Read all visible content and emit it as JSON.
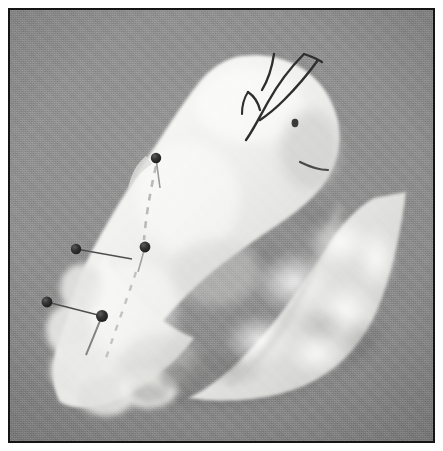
{
  "photo": {
    "title": "Pinned white plush bird form on gray background",
    "subject": "white-fabric-bird-craft",
    "border_color": "#141414",
    "border_width_px": 2,
    "outer_margin_px": 8,
    "frame": {
      "width_px": 427,
      "height_px": 435
    },
    "canvas": {
      "width_px": 443,
      "height_px": 451
    },
    "background": {
      "name": "studio-gray-paper",
      "color": "#8b8b8b",
      "highlight_color": "#949494",
      "shadow_color": "#7d7d7d"
    },
    "objects": {
      "body": {
        "name": "white-plush-body",
        "color": "#f2f2f0",
        "shade_color": "#d8d8d6",
        "description": "Large white quilted body panel, teardrop shaped, tilted left"
      },
      "wing": {
        "name": "white-fur-wing-panel",
        "color": "#eeeeec",
        "shade_color": "#cfcfcd",
        "description": "Fluffy white fur triangular wing panel on the right"
      },
      "eye": {
        "name": "stitched-eye",
        "color": "#3a3a3a",
        "cx": 285,
        "cy": 113
      },
      "beak_line": {
        "name": "stitched-beak-line",
        "color": "#4a4a4a"
      }
    },
    "threads": [
      {
        "name": "thread-crest-long",
        "color": "#2e2e2e"
      },
      {
        "name": "thread-crest-short",
        "color": "#2e2e2e"
      },
      {
        "name": "thread-hook",
        "color": "#2e2e2e"
      }
    ],
    "pins": [
      {
        "name": "pin-upper-body",
        "head_x": 146,
        "head_y": 148,
        "head_r": 5.2,
        "tip_x": 150,
        "tip_y": 178,
        "color": "#2b2b2b"
      },
      {
        "name": "pin-mid-body",
        "head_x": 135,
        "head_y": 237,
        "head_r": 5.4,
        "tip_x": 128,
        "tip_y": 262,
        "color": "#2b2b2b"
      },
      {
        "name": "pin-left-upper",
        "head_x": 66,
        "head_y": 239,
        "head_r": 5.2,
        "tip_x": 122,
        "tip_y": 249,
        "color": "#2b2b2b"
      },
      {
        "name": "pin-left-lower",
        "head_x": 37,
        "head_y": 292,
        "head_r": 5.4,
        "tip_x": 96,
        "tip_y": 307,
        "color": "#2b2b2b"
      },
      {
        "name": "pin-lower-body",
        "head_x": 92,
        "head_y": 306,
        "head_r": 6.0,
        "tip_x": 76,
        "tip_y": 345,
        "color": "#2b2b2b"
      }
    ],
    "seams": [
      {
        "name": "seam-dashed-left",
        "color": "#b9b9b7"
      },
      {
        "name": "seam-dashed-lower",
        "color": "#c2c2c0"
      }
    ]
  }
}
